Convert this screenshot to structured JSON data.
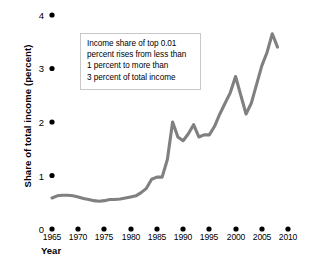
{
  "chart_data": {
    "type": "line",
    "title": "",
    "xlabel": "Year",
    "ylabel": "Share of total income (percent)",
    "xlim": [
      1965,
      2010
    ],
    "ylim": [
      0,
      4
    ],
    "grid": false,
    "legend": "none",
    "line_color": "#808080",
    "xticks": [
      "1965",
      "1970",
      "1975",
      "1980",
      "1985",
      "1990",
      "1995",
      "2000",
      "2005",
      "2010"
    ],
    "xtick_values": [
      1965,
      1970,
      1975,
      1980,
      1985,
      1990,
      1995,
      2000,
      2005,
      2010
    ],
    "yticks": [
      "0",
      "1",
      "2",
      "3",
      "4"
    ],
    "ytick_values": [
      0,
      1,
      2,
      3,
      4
    ],
    "series": [
      {
        "name": "Income share of top 0.01 percent",
        "x": [
          1965,
          1966,
          1967,
          1968,
          1969,
          1970,
          1971,
          1972,
          1973,
          1974,
          1975,
          1976,
          1977,
          1978,
          1979,
          1980,
          1981,
          1982,
          1983,
          1984,
          1985,
          1986,
          1987,
          1988,
          1989,
          1990,
          1991,
          1992,
          1993,
          1994,
          1995,
          1996,
          1997,
          1998,
          1999,
          2000,
          2001,
          2002,
          2003,
          2004,
          2005,
          2006,
          2007,
          2008
        ],
        "values": [
          0.58,
          0.62,
          0.63,
          0.63,
          0.62,
          0.6,
          0.57,
          0.55,
          0.53,
          0.52,
          0.53,
          0.55,
          0.55,
          0.56,
          0.58,
          0.6,
          0.62,
          0.68,
          0.76,
          0.93,
          0.97,
          0.97,
          1.3,
          2.0,
          1.72,
          1.65,
          1.78,
          1.95,
          1.72,
          1.76,
          1.76,
          1.92,
          2.15,
          2.35,
          2.55,
          2.85,
          2.5,
          2.15,
          2.35,
          2.7,
          3.05,
          3.3,
          3.65,
          3.4
        ]
      }
    ],
    "annotation": {
      "lines": [
        "Income share of top 0.01",
        "percent rises from less than",
        "1 percent to more than",
        "3 percent of total income"
      ]
    }
  }
}
